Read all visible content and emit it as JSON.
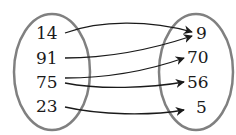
{
  "diagram": {
    "type": "mapping",
    "domain": [
      "14",
      "91",
      "75",
      "23"
    ],
    "range": [
      "9",
      "70",
      "56",
      "5"
    ],
    "arrows": [
      {
        "from": "14",
        "to": "9"
      },
      {
        "from": "91",
        "to": "9"
      },
      {
        "from": "75",
        "to": "70"
      },
      {
        "from": "75",
        "to": "56"
      },
      {
        "from": "23",
        "to": "5"
      }
    ],
    "colors": {
      "ellipse": "#808080",
      "arrow": "#1a1a1a",
      "text": "#1a1a1a"
    }
  }
}
